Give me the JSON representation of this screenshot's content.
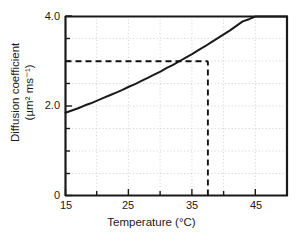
{
  "chart_data": {
    "type": "line",
    "title": "",
    "xlabel": "Temperature (°C)",
    "ylabel_line1": "Diffusion coefficient",
    "ylabel_line2": "(µm² ms⁻¹)",
    "xlim": [
      15,
      50
    ],
    "ylim": [
      0,
      4.0
    ],
    "x_major_ticks": [
      15,
      25,
      35,
      45
    ],
    "x_major_tick_labels": [
      "15",
      "25",
      "35",
      "45"
    ],
    "x_minor_tick_interval": 5,
    "y_major_ticks": [
      0,
      2.0,
      4.0
    ],
    "y_major_tick_labels": [
      "0",
      "2.0",
      "4.0"
    ],
    "y_minor_tick_interval": 0.5,
    "grid": true,
    "grid_style": "dotted",
    "grid_color": "#cccccc",
    "legend": "none",
    "line_color": "#1a1a1a",
    "line_width": 2,
    "x": [
      15,
      16,
      17,
      18,
      19,
      20,
      21,
      22,
      23,
      24,
      25,
      26,
      27,
      28,
      29,
      30,
      31,
      32,
      33,
      34,
      35,
      36,
      37,
      38,
      39,
      40,
      41,
      42,
      43,
      44,
      45,
      46,
      47,
      48,
      49,
      50
    ],
    "values": [
      1.85,
      1.9,
      1.95,
      2.01,
      2.06,
      2.12,
      2.18,
      2.24,
      2.3,
      2.36,
      2.43,
      2.49,
      2.56,
      2.63,
      2.7,
      2.77,
      2.85,
      2.92,
      3.0,
      3.08,
      3.16,
      3.25,
      3.33,
      3.42,
      3.51,
      3.6,
      3.69,
      3.79,
      3.89,
      3.94,
      4.0,
      4.0,
      4.0,
      4.0,
      4.0,
      4.0
    ],
    "annotations": [
      {
        "name": "horizontal-guide",
        "style": "dashed",
        "y_value": 3.0,
        "from_x": 15,
        "to_x": 37.5
      },
      {
        "name": "vertical-guide",
        "style": "dashed",
        "x_value": 37.5,
        "from_y": 0,
        "to_y": 3.0
      }
    ]
  },
  "axes": {
    "y_labels": [
      {
        "text": "4.0",
        "value": 4.0
      },
      {
        "text": "2.0",
        "value": 2.0
      },
      {
        "text": "0",
        "value": 0
      }
    ],
    "x_labels": [
      {
        "text": "15",
        "value": 15
      },
      {
        "text": "25",
        "value": 25
      },
      {
        "text": "35",
        "value": 35
      },
      {
        "text": "45",
        "value": 45
      }
    ]
  }
}
